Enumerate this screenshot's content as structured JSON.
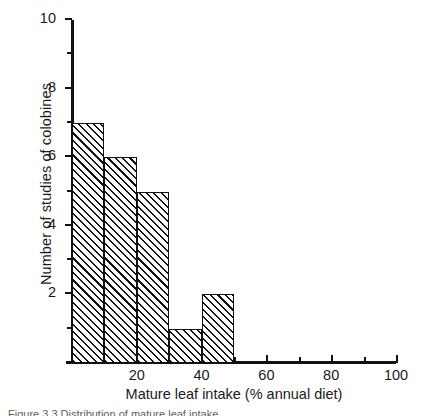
{
  "chart_data": {
    "type": "bar",
    "title": "",
    "xlabel": "Mature leaf intake (% annual diet)",
    "ylabel": "Number of studies of colobines",
    "categories": [
      "0–10",
      "10–20",
      "20–30",
      "30–40",
      "40–50"
    ],
    "bin_edges": [
      0,
      10,
      20,
      30,
      40,
      50
    ],
    "values": [
      7,
      6,
      5,
      1,
      2
    ],
    "bars": [
      {
        "x0": 0,
        "x1": 10,
        "value": 7
      },
      {
        "x0": 10,
        "x1": 20,
        "value": 6
      },
      {
        "x0": 20,
        "x1": 30,
        "value": 5
      },
      {
        "x0": 30,
        "x1": 40,
        "value": 1
      },
      {
        "x0": 40,
        "x1": 50,
        "value": 2
      }
    ],
    "xlim": [
      0,
      100
    ],
    "ylim": [
      0,
      10
    ],
    "x_major_ticks": [
      20,
      40,
      60,
      80,
      100
    ],
    "x_minor_ticks": [
      0,
      10,
      30,
      50,
      70,
      90
    ],
    "x_tick_labels": [
      "20",
      "40",
      "60",
      "80",
      "100"
    ],
    "y_major_ticks": [
      2,
      4,
      6,
      8,
      10
    ],
    "y_minor_ticks": [
      1,
      3,
      5,
      7,
      9
    ],
    "y_tick_labels": [
      "2",
      "4",
      "6",
      "8",
      "10"
    ],
    "grid": false,
    "legend": null,
    "bar_fill": "hatched-diagonal",
    "colors": {
      "axis": "#111111",
      "bar_edge": "#111111",
      "bar_hatch": "#111111",
      "background": "#ffffff"
    }
  },
  "caption": {
    "text": "Figure 3.3 Distribution of mature leaf intake"
  }
}
